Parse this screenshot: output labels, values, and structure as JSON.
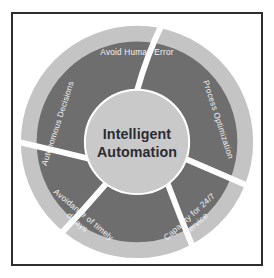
{
  "page": {
    "clipped_top_text": "· · ·"
  },
  "diagram": {
    "type": "segmented-ring",
    "center": {
      "line1": "Intelligent",
      "line2": "Automation",
      "text_color": "#2b2b33",
      "fill_color": "#c9c9c9"
    },
    "colors": {
      "outer_ring": "#c4c4c4",
      "segment": "#6e6e6e",
      "gap": "#ffffff",
      "frame_border": "#2d2d2d",
      "background": "#ffffff",
      "label_text": "#f2f2f2"
    },
    "segments": [
      {
        "id": "avoid-human-error",
        "label": "Avoid Human Error",
        "lines": [
          "Avoid Human Error"
        ],
        "position": "top",
        "angle_deg": 0
      },
      {
        "id": "process-optimization",
        "label": "Process Optimization",
        "lines": [
          "Process Optimization"
        ],
        "position": "right",
        "angle_deg": 72
      },
      {
        "id": "capacity-for-24-7-service",
        "label": "Capacity for 24/7 Service",
        "lines": [
          "Capacity for 24/7",
          "Service"
        ],
        "position": "bottom-right",
        "angle_deg": 144
      },
      {
        "id": "avoidance-of-timely-delays",
        "label": "Avoidance of timely delays",
        "lines": [
          "Avoidance of timely",
          "delays"
        ],
        "position": "bottom-left",
        "angle_deg": 216
      },
      {
        "id": "autonomous-decisions",
        "label": "Autonomous Decisions",
        "lines": [
          "Autonomous Decisions"
        ],
        "position": "left",
        "angle_deg": 288
      }
    ]
  }
}
